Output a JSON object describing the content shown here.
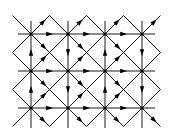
{
  "diagram": {
    "type": "directed-lattice-graph",
    "colors": {
      "line": "#1a1a1a",
      "node": "#000000",
      "background": "#ffffff"
    },
    "nodes_x": [
      31,
      68,
      105,
      142
    ],
    "nodes_y": [
      34,
      71,
      108
    ],
    "grid": {
      "columns": 4,
      "rows": 3,
      "spacing": 37
    },
    "edge_directions": {
      "horizontal": "right",
      "vertical_left_of_cell": "up",
      "vertical_right_of_cell": "down",
      "diagonals": "toward-cell-center"
    },
    "outer_extension": 18
  }
}
